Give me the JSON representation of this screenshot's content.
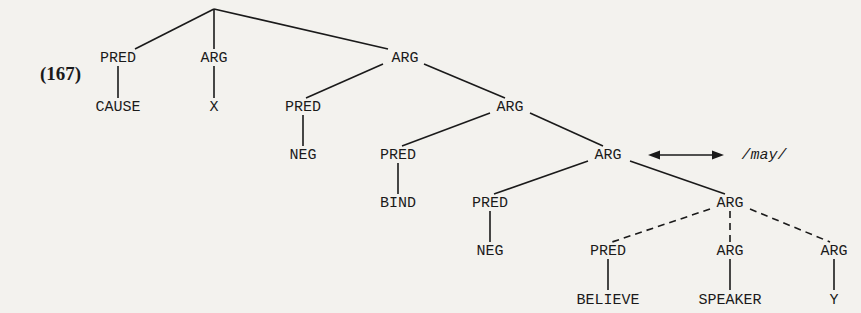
{
  "example_number": "(167)",
  "nodes": {
    "n_pred_cause": "PRED",
    "n_cause": "CAUSE",
    "n_arg_x": "ARG",
    "n_x": "X",
    "n_arg_1": "ARG",
    "n_pred_neg1": "PRED",
    "n_neg1": "NEG",
    "n_arg_2": "ARG",
    "n_pred_bind": "PRED",
    "n_bind": "BIND",
    "n_arg_3": "ARG",
    "n_pred_neg2": "PRED",
    "n_neg2": "NEG",
    "n_arg_4": "ARG",
    "n_pred_believe": "PRED",
    "n_believe": "BELIEVE",
    "n_arg_speaker": "ARG",
    "n_speaker": "SPEAKER",
    "n_arg_y": "ARG",
    "n_y": "Y"
  },
  "annotation": {
    "lexical_item": "/may/",
    "relation": "double-headed-arrow"
  },
  "colors": {
    "ink": "#1a1a1a",
    "paper": "#f3f2ee"
  }
}
